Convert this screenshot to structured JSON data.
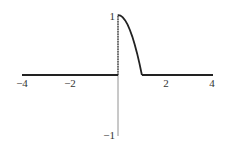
{
  "chart_data": {
    "type": "line",
    "title": "",
    "xlabel": "",
    "ylabel": "",
    "xlim": [
      -4,
      4
    ],
    "ylim": [
      -1,
      1
    ],
    "grid": false,
    "legend": null,
    "x_ticks": [
      "-4",
      "-2",
      "2",
      "4"
    ],
    "y_ticks": [
      "1",
      "-1"
    ],
    "series": [
      {
        "name": "f(x)",
        "description": "f(x) = 1 - x^2 on [0,1], 0 elsewhere",
        "x": [
          -4,
          0,
          0.1,
          0.2,
          0.3,
          0.4,
          0.5,
          0.6,
          0.7,
          0.8,
          0.9,
          1.0,
          4
        ],
        "y": [
          0,
          1,
          0.99,
          0.96,
          0.91,
          0.84,
          0.75,
          0.64,
          0.51,
          0.36,
          0.19,
          0,
          0
        ]
      }
    ],
    "annotations": [
      {
        "type": "dashed-vertical",
        "x": 0,
        "y_from": 0,
        "y_to": 1
      }
    ]
  },
  "axes": {
    "x_labels": [
      "−4",
      "−2",
      "2",
      "4"
    ],
    "y_labels": [
      "1",
      "−1"
    ]
  }
}
